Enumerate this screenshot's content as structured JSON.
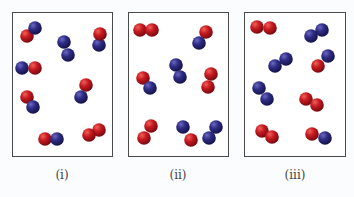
{
  "figure": {
    "panels": [
      {
        "label": "(i)",
        "box": [
          12,
          12,
          100,
          144
        ],
        "molecules": [
          {
            "type": "heteronuclear",
            "atoms": [
              {
                "color": "red",
                "x": 27,
                "y": 36
              },
              {
                "color": "blue",
                "x": 35,
                "y": 28
              }
            ]
          },
          {
            "type": "homonuclear-blue",
            "atoms": [
              {
                "color": "blue",
                "x": 64,
                "y": 42
              },
              {
                "color": "blue",
                "x": 68,
                "y": 55
              }
            ]
          },
          {
            "type": "heteronuclear",
            "atoms": [
              {
                "color": "blue",
                "x": 99,
                "y": 45
              },
              {
                "color": "red",
                "x": 100,
                "y": 34
              }
            ]
          },
          {
            "type": "heteronuclear",
            "atoms": [
              {
                "color": "blue",
                "x": 22,
                "y": 68
              },
              {
                "color": "red",
                "x": 35,
                "y": 68
              }
            ]
          },
          {
            "type": "heteronuclear",
            "atoms": [
              {
                "color": "red",
                "x": 27,
                "y": 97
              },
              {
                "color": "blue",
                "x": 33,
                "y": 107
              }
            ]
          },
          {
            "type": "heteronuclear",
            "atoms": [
              {
                "color": "red",
                "x": 86,
                "y": 85
              },
              {
                "color": "blue",
                "x": 81,
                "y": 97
              }
            ]
          },
          {
            "type": "heteronuclear",
            "atoms": [
              {
                "color": "red",
                "x": 45,
                "y": 139
              },
              {
                "color": "blue",
                "x": 57,
                "y": 139
              }
            ]
          },
          {
            "type": "homonuclear-red",
            "atoms": [
              {
                "color": "red",
                "x": 99,
                "y": 130
              },
              {
                "color": "red",
                "x": 89,
                "y": 135
              }
            ]
          }
        ]
      },
      {
        "label": "(ii)",
        "box": [
          128,
          12,
          101,
          144
        ],
        "molecules": [
          {
            "type": "homonuclear-red",
            "atoms": [
              {
                "color": "red",
                "x": 140,
                "y": 30
              },
              {
                "color": "red",
                "x": 152,
                "y": 30
              }
            ]
          },
          {
            "type": "heteronuclear",
            "atoms": [
              {
                "color": "red",
                "x": 206,
                "y": 32
              },
              {
                "color": "blue",
                "x": 199,
                "y": 43
              }
            ]
          },
          {
            "type": "homonuclear-blue",
            "atoms": [
              {
                "color": "blue",
                "x": 176,
                "y": 65
              },
              {
                "color": "blue",
                "x": 180,
                "y": 77
              }
            ]
          },
          {
            "type": "heteronuclear",
            "atoms": [
              {
                "color": "red",
                "x": 143,
                "y": 78
              },
              {
                "color": "blue",
                "x": 150,
                "y": 88
              }
            ]
          },
          {
            "type": "homonuclear-red",
            "atoms": [
              {
                "color": "red",
                "x": 211,
                "y": 74
              },
              {
                "color": "red",
                "x": 208,
                "y": 87
              }
            ]
          },
          {
            "type": "homonuclear-red",
            "atoms": [
              {
                "color": "red",
                "x": 151,
                "y": 126
              },
              {
                "color": "red",
                "x": 144,
                "y": 138
              }
            ]
          },
          {
            "type": "heteronuclear",
            "atoms": [
              {
                "color": "blue",
                "x": 183,
                "y": 127
              },
              {
                "color": "red",
                "x": 191,
                "y": 140
              }
            ]
          },
          {
            "type": "homonuclear-blue",
            "atoms": [
              {
                "color": "blue",
                "x": 216,
                "y": 127
              },
              {
                "color": "blue",
                "x": 209,
                "y": 138
              }
            ]
          }
        ]
      },
      {
        "label": "(iii)",
        "box": [
          244,
          12,
          102,
          144
        ],
        "molecules": [
          {
            "type": "homonuclear-red",
            "atoms": [
              {
                "color": "red",
                "x": 257,
                "y": 27
              },
              {
                "color": "red",
                "x": 270,
                "y": 28
              }
            ]
          },
          {
            "type": "homonuclear-blue",
            "atoms": [
              {
                "color": "blue",
                "x": 322,
                "y": 30
              },
              {
                "color": "blue",
                "x": 311,
                "y": 36
              }
            ]
          },
          {
            "type": "homonuclear-blue",
            "atoms": [
              {
                "color": "blue",
                "x": 286,
                "y": 59
              },
              {
                "color": "blue",
                "x": 275,
                "y": 66
              }
            ]
          },
          {
            "type": "heteronuclear",
            "atoms": [
              {
                "color": "blue",
                "x": 328,
                "y": 56
              },
              {
                "color": "red",
                "x": 318,
                "y": 66
              }
            ]
          },
          {
            "type": "homonuclear-blue",
            "atoms": [
              {
                "color": "blue",
                "x": 259,
                "y": 88
              },
              {
                "color": "blue",
                "x": 267,
                "y": 99
              }
            ]
          },
          {
            "type": "homonuclear-red",
            "atoms": [
              {
                "color": "red",
                "x": 306,
                "y": 99
              },
              {
                "color": "red",
                "x": 317,
                "y": 105
              }
            ]
          },
          {
            "type": "homonuclear-red",
            "atoms": [
              {
                "color": "red",
                "x": 262,
                "y": 131
              },
              {
                "color": "red",
                "x": 272,
                "y": 137
              }
            ]
          },
          {
            "type": "heteronuclear",
            "atoms": [
              {
                "color": "red",
                "x": 312,
                "y": 134
              },
              {
                "color": "blue",
                "x": 325,
                "y": 138
              }
            ]
          }
        ]
      }
    ],
    "atom_radius": 6.8,
    "colors": {
      "red": "#c0171f",
      "blue": "#2c2a7e",
      "border": "#4a4a4a",
      "label": "#444444"
    }
  }
}
